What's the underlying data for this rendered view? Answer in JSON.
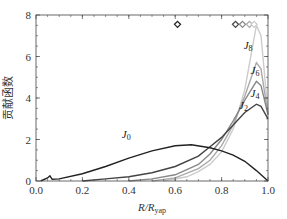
{
  "chart_data": {
    "type": "line",
    "title": "",
    "xlabel": "R/R_yap",
    "xlabel_main": "R/R",
    "xlabel_sub": "yap",
    "ylabel": "贡献函数",
    "xlim": [
      0.0,
      1.0
    ],
    "ylim": [
      0,
      8
    ],
    "xticks": [
      "0.0",
      "0.2",
      "0.4",
      "0.6",
      "0.8",
      "1.0"
    ],
    "yticks": [
      "0",
      "2",
      "4",
      "6",
      "8"
    ],
    "grid": false,
    "legend": "inline labels",
    "series": [
      {
        "name": "J0",
        "label_main": "J",
        "label_sub": "0",
        "color": "#222222",
        "x": [
          0.02,
          0.05,
          0.06,
          0.07,
          0.1,
          0.2,
          0.3,
          0.4,
          0.5,
          0.6,
          0.67,
          0.75,
          0.8,
          0.85,
          0.9,
          0.95,
          1.0
        ],
        "y": [
          0.0,
          0.15,
          0.25,
          0.08,
          0.1,
          0.35,
          0.7,
          1.1,
          1.45,
          1.7,
          1.75,
          1.6,
          1.45,
          1.25,
          0.95,
          0.5,
          0.0
        ]
      },
      {
        "name": "J2",
        "label_main": "J",
        "label_sub": "2",
        "color": "#444444",
        "x": [
          0.2,
          0.3,
          0.4,
          0.5,
          0.6,
          0.7,
          0.75,
          0.8,
          0.85,
          0.9,
          0.95,
          0.97,
          1.0
        ],
        "y": [
          0.0,
          0.1,
          0.2,
          0.4,
          0.7,
          1.2,
          1.65,
          2.1,
          2.7,
          3.3,
          3.7,
          3.6,
          3.0
        ]
      },
      {
        "name": "J4",
        "label_main": "J",
        "label_sub": "4",
        "color": "#888888",
        "x": [
          0.4,
          0.5,
          0.6,
          0.7,
          0.75,
          0.8,
          0.85,
          0.9,
          0.95,
          0.97,
          1.0
        ],
        "y": [
          0.0,
          0.1,
          0.3,
          0.8,
          1.3,
          2.0,
          2.9,
          3.9,
          4.8,
          4.6,
          3.2
        ]
      },
      {
        "name": "J6",
        "label_main": "J",
        "label_sub": "6",
        "color": "#aaaaaa",
        "x": [
          0.5,
          0.6,
          0.7,
          0.75,
          0.8,
          0.85,
          0.9,
          0.95,
          0.97,
          1.0
        ],
        "y": [
          0.0,
          0.15,
          0.6,
          1.0,
          1.7,
          2.7,
          4.1,
          5.7,
          5.4,
          3.2
        ]
      },
      {
        "name": "J8",
        "label_main": "J",
        "label_sub": "8",
        "color": "#cccccc",
        "x": [
          0.55,
          0.65,
          0.7,
          0.75,
          0.8,
          0.85,
          0.9,
          0.95,
          0.97,
          1.0
        ],
        "y": [
          0.0,
          0.2,
          0.45,
          0.8,
          1.4,
          2.5,
          4.4,
          7.5,
          7.0,
          3.3
        ]
      }
    ],
    "markers": [
      {
        "x": 0.61,
        "y": 7.55,
        "color": "#222222"
      },
      {
        "x": 0.86,
        "y": 7.55,
        "color": "#444444"
      },
      {
        "x": 0.89,
        "y": 7.55,
        "color": "#888888"
      },
      {
        "x": 0.92,
        "y": 7.55,
        "color": "#aaaaaa"
      },
      {
        "x": 0.94,
        "y": 7.55,
        "color": "#cccccc"
      }
    ],
    "label_positions": {
      "J0": {
        "x": 0.37,
        "y": 2.05
      },
      "J2": {
        "x": 0.875,
        "y": 3.45
      },
      "J4": {
        "x": 0.925,
        "y": 4.05
      },
      "J6": {
        "x": 0.925,
        "y": 5.15
      },
      "J8": {
        "x": 0.895,
        "y": 6.35
      }
    }
  }
}
